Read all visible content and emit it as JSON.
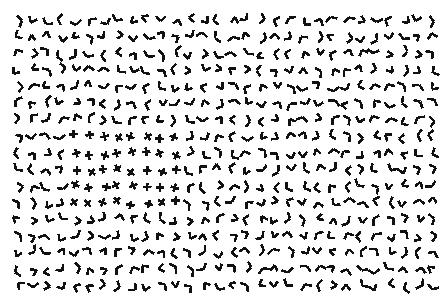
{
  "figure": {
    "name": "texture-segregation-stimulus",
    "width": 446,
    "height": 303,
    "background_color": "#ffffff",
    "ink_color": "#111111"
  },
  "array": {
    "margin_left": 11,
    "margin_top": 12,
    "margin_right": 8,
    "margin_bottom": 10,
    "columns": 30,
    "rows": 17,
    "cell_width": 14.3,
    "cell_height": 16.6,
    "jitter_px": 2.6,
    "element_arm_length": 7.0,
    "stroke_width": 2.6,
    "stroke_linecap": "butt"
  },
  "distractor": {
    "name": "corner-element",
    "label": "L / V corner (two segments joined, non-crossing)",
    "junction_type": "L",
    "arm_angle_min_deg": 55,
    "arm_angle_max_deg": 125,
    "orientation": "random"
  },
  "target": {
    "name": "cross-element",
    "label": "Plus / X cross (two segments intersecting at midpoint)",
    "junction_type": "X",
    "arm_angle_deg": 90,
    "orientation": "random"
  },
  "target_patch": {
    "name": "target-region",
    "label": "Cross-element patch",
    "col_start": 4,
    "col_end": 11,
    "row_start": 7,
    "row_end": 11,
    "columns": 8,
    "rows": 5,
    "left_px": 63,
    "top_px": 118,
    "right_px": 168,
    "bottom_px": 187
  },
  "seed": 20240517
}
